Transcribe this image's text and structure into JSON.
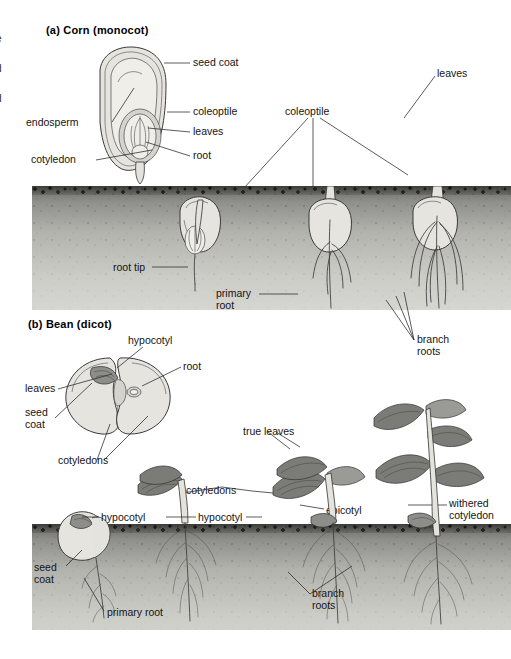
{
  "figure": {
    "left_margin_cutoff": "e\nd\nd",
    "panels": [
      {
        "id": "corn",
        "heading": "(a) Corn (monocot)",
        "seed_labels": [
          {
            "name": "seed-coat",
            "text": "seed coat"
          },
          {
            "name": "coleoptile",
            "text": "coleoptile"
          },
          {
            "name": "leaves",
            "text": "leaves"
          },
          {
            "name": "root",
            "text": "root"
          },
          {
            "name": "endosperm",
            "text": "endosperm"
          },
          {
            "name": "cotyledon",
            "text": "cotyledon"
          }
        ],
        "stage_labels": [
          {
            "name": "coleoptile",
            "text": "coleoptile"
          },
          {
            "name": "leaves",
            "text": "leaves"
          },
          {
            "name": "root-tip",
            "text": "root tip"
          },
          {
            "name": "primary-root",
            "text": "primary\nroot"
          },
          {
            "name": "branch-roots",
            "text": "branch\nroots"
          }
        ]
      },
      {
        "id": "bean",
        "heading": "(b) Bean (dicot)",
        "seed_labels": [
          {
            "name": "hypocotyl",
            "text": "hypocotyl"
          },
          {
            "name": "root",
            "text": "root"
          },
          {
            "name": "leaves",
            "text": "leaves"
          },
          {
            "name": "seed-coat",
            "text": "seed\ncoat"
          },
          {
            "name": "cotyledons",
            "text": "cotyledons"
          }
        ],
        "stage_labels": [
          {
            "name": "true-leaves",
            "text": "true leaves"
          },
          {
            "name": "cotyledons",
            "text": "cotyledons"
          },
          {
            "name": "epicotyl",
            "text": "epicotyl"
          },
          {
            "name": "withered-cotyledon",
            "text": "withered\ncotyledon"
          },
          {
            "name": "hypocotyl-1",
            "text": "hypocotyl"
          },
          {
            "name": "hypocotyl-2",
            "text": "hypocotyl"
          },
          {
            "name": "hypocotyl-3",
            "text": "hypocotyl"
          },
          {
            "name": "seed-coat",
            "text": "seed\ncoat"
          },
          {
            "name": "primary-root",
            "text": "primary root"
          },
          {
            "name": "branch-roots",
            "text": "branch\nroots"
          }
        ]
      }
    ]
  }
}
